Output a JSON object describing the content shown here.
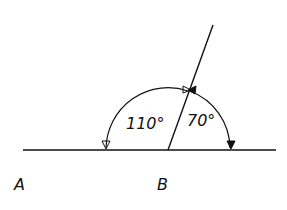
{
  "diagram": {
    "type": "supplementary-angles",
    "points": {
      "A": {
        "label": "A"
      },
      "B": {
        "label": "B"
      }
    },
    "angles": [
      {
        "label": "110°",
        "value": 110
      },
      {
        "label": "70°",
        "value": 70
      }
    ],
    "colors": {
      "stroke": "#111111",
      "background": "#ffffff"
    }
  }
}
